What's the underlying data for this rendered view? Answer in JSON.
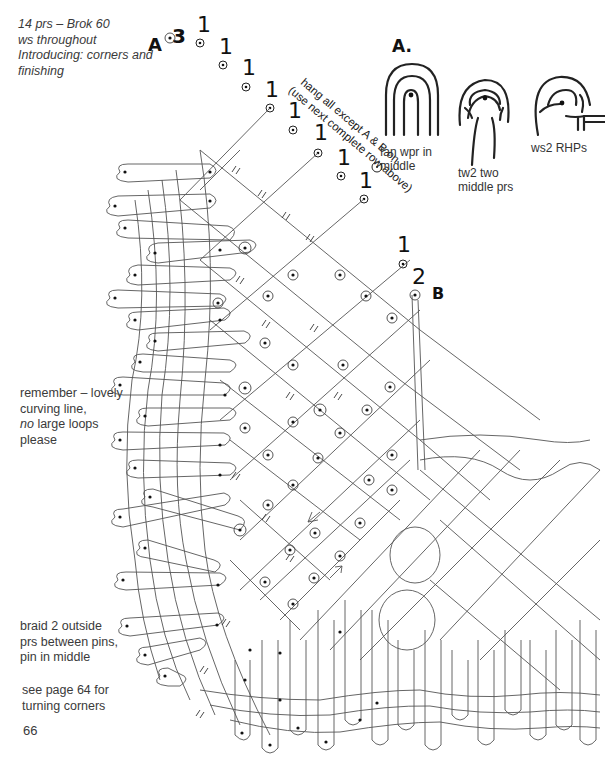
{
  "header_notes": {
    "lines": [
      "14 prs – Brok 60",
      "ws throughout",
      "Introducing: corners and",
      "finishing"
    ]
  },
  "side_notes": {
    "curving": {
      "lines": [
        "remember – lovely",
        "curving line,"
      ],
      "em": "no",
      "rest": " large loops",
      "last": "please"
    },
    "braid": {
      "lines": [
        "braid 2 outside",
        "prs between pins,",
        "pin in middle"
      ]
    },
    "see_page": {
      "lines": [
        "see page 64 for",
        "turning corners"
      ]
    }
  },
  "page_number": "66",
  "hang_instruction": {
    "line1": "hang all except A & B on",
    "line2": "(use next complete row above)"
  },
  "markers": {
    "A": "A",
    "B": "B",
    "three": "3",
    "two": "2",
    "one": "1"
  },
  "inset_diagrams": {
    "title": "A.",
    "items": [
      {
        "caption": [
          "fan wpr in",
          "middle"
        ]
      },
      {
        "caption": [
          "tw2 two",
          "middle prs"
        ]
      },
      {
        "caption": [
          "ws2 RHPs"
        ]
      }
    ]
  },
  "colors": {
    "ink": "#333333",
    "background": "#ffffff"
  }
}
